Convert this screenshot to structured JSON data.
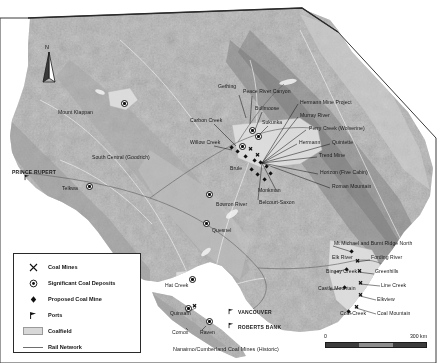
{
  "map": {
    "region": "British Columbia coal resources map",
    "north_arrow_label": "N",
    "scale": {
      "min": "0",
      "max": "300 km"
    },
    "colors": {
      "land": "#b9b9b9",
      "ocean": "#ffffff",
      "coalfield": "#d8d8d8",
      "rail": "#6e6e6e",
      "label": "#1b1b1b",
      "symbol": "#111111"
    }
  },
  "legend": {
    "items": [
      {
        "icon": "coal-mine-icon",
        "label": "Coal Mines"
      },
      {
        "icon": "significant-deposit-icon",
        "label": "Significant Coal Deposits"
      },
      {
        "icon": "proposed-mine-icon",
        "label": "Proposed Coal Mine"
      },
      {
        "icon": "port-icon",
        "label": "Ports"
      },
      {
        "icon": "coalfield-swatch",
        "label": "Coalfield"
      },
      {
        "icon": "rail-line-icon",
        "label": "Rail Network"
      }
    ]
  },
  "labels": {
    "cities": [
      {
        "name": "PRINCE RUPERT",
        "x": 12,
        "y": 170
      },
      {
        "name": "VANCOUVER",
        "x": 238,
        "y": 312
      },
      {
        "name": "ROBERTS BANK",
        "x": 238,
        "y": 327
      }
    ],
    "places": [
      {
        "name": "Mount Klappan",
        "x": 58,
        "y": 110
      },
      {
        "name": "Telkwa",
        "x": 62,
        "y": 186
      },
      {
        "name": "South Central (Goodrich)",
        "x": 92,
        "y": 155
      },
      {
        "name": "Carbon Creek",
        "x": 190,
        "y": 118
      },
      {
        "name": "Willow Creek",
        "x": 190,
        "y": 140
      },
      {
        "name": "Gething",
        "x": 218,
        "y": 84
      },
      {
        "name": "Peace River Canyon",
        "x": 243,
        "y": 89
      },
      {
        "name": "Bullmoose",
        "x": 255,
        "y": 106
      },
      {
        "name": "Sukunka",
        "x": 262,
        "y": 120
      },
      {
        "name": "Brule",
        "x": 230,
        "y": 166
      },
      {
        "name": "Monkman",
        "x": 258,
        "y": 188
      },
      {
        "name": "Belcourt-Saxon",
        "x": 259,
        "y": 200
      },
      {
        "name": "Bowron River",
        "x": 216,
        "y": 202
      },
      {
        "name": "Quesnel",
        "x": 212,
        "y": 228
      },
      {
        "name": "Hat Creek",
        "x": 165,
        "y": 283
      },
      {
        "name": "Quinsam",
        "x": 170,
        "y": 311
      },
      {
        "name": "Comox",
        "x": 172,
        "y": 330
      },
      {
        "name": "Raven",
        "x": 200,
        "y": 330
      }
    ],
    "callouts_ne": [
      {
        "name": "Hermann Mine Project",
        "x": 300,
        "y": 101
      },
      {
        "name": "Murray River",
        "x": 300,
        "y": 114
      },
      {
        "name": "Perry Creek (Wolverine)",
        "x": 310,
        "y": 127
      },
      {
        "name": "Hermann",
        "x": 300,
        "y": 141
      },
      {
        "name": "Quintette",
        "x": 333,
        "y": 141
      },
      {
        "name": "Trend Mine",
        "x": 320,
        "y": 154
      },
      {
        "name": "Horizon (Five Cabin)",
        "x": 322,
        "y": 172
      },
      {
        "name": "Roman Mountain",
        "x": 333,
        "y": 185
      }
    ],
    "callouts_se": [
      {
        "name": "Mt Michael and Burnt Ridge North",
        "x": 335,
        "y": 243
      },
      {
        "name": "Elk River",
        "x": 333,
        "y": 257
      },
      {
        "name": "Fording River",
        "x": 372,
        "y": 257
      },
      {
        "name": "Line Creek",
        "x": 382,
        "y": 284
      },
      {
        "name": "Greenhills",
        "x": 376,
        "y": 271
      },
      {
        "name": "Elkview",
        "x": 378,
        "y": 298
      },
      {
        "name": "Bingay Creek",
        "x": 327,
        "y": 271
      },
      {
        "name": "Castle Mountain",
        "x": 321,
        "y": 288
      },
      {
        "name": "Coal Creek",
        "x": 341,
        "y": 313
      },
      {
        "name": "Coal Mountain",
        "x": 378,
        "y": 313
      }
    ],
    "historic": {
      "name": "Nanaimo/Cumberland Coal Mines (Historic)",
      "x": 178,
      "y": 349
    }
  }
}
